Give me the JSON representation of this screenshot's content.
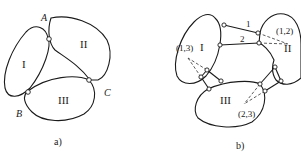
{
  "figure": {
    "panel_a": {
      "caption": "a)",
      "bodies": [
        "I",
        "II",
        "III"
      ],
      "joints": [
        "A",
        "B",
        "C"
      ]
    },
    "panel_b": {
      "caption": "b)",
      "bodies": [
        "I",
        "II",
        "III"
      ],
      "links": [
        "1",
        "2"
      ],
      "instant_centers": [
        "(1,2)",
        "(1,3)",
        "(2,3)"
      ]
    }
  }
}
